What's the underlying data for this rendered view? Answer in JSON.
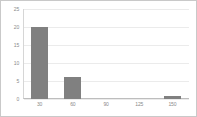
{
  "chart_data": {
    "type": "bar",
    "title": "",
    "xlabel": "",
    "ylabel": "",
    "categories": [
      "30",
      "60",
      "90",
      "125",
      "150"
    ],
    "values": [
      20,
      6,
      0,
      0,
      0.7
    ],
    "ylim": [
      0,
      25
    ],
    "yticks": [
      0,
      5,
      10,
      15,
      20,
      25
    ],
    "ytick_labels": [
      "0",
      "5",
      "10",
      "15",
      "20",
      "25"
    ],
    "grid": true,
    "legend": "none",
    "series": [
      {
        "name": "series-1",
        "values": [
          20,
          6,
          0,
          0,
          0.7
        ]
      }
    ]
  },
  "style": {
    "bar_color": "#808080",
    "grid_color": "#ebebeb",
    "axis_color": "#bdbdbd",
    "frame_color": "#c9c9c9",
    "label_color": "#8a8a8a",
    "background": "#ffffff"
  }
}
